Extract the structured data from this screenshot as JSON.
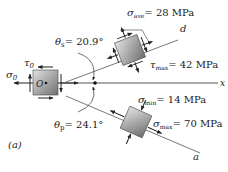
{
  "figure": {
    "panel_label": "(a)",
    "origin_label": "O",
    "axis_x_label": "x",
    "axis_d_label": "d",
    "axis_a_label": "a",
    "theta_s": {
      "symbol": "θ",
      "sub": "s",
      "value": "= 20.9°"
    },
    "theta_p": {
      "symbol": "θ",
      "sub": "p",
      "value": "= 24.1°"
    },
    "sigma0": {
      "symbol": "σ",
      "sub": "0"
    },
    "tau0": {
      "symbol": "τ",
      "sub": "0"
    },
    "sigma_ave": {
      "symbol": "σ",
      "sub": "ave",
      "value": "= 28 MPa"
    },
    "tau_max": {
      "symbol": "τ",
      "sub": "max",
      "value": "= 42 MPa"
    },
    "sigma_min": {
      "symbol": "σ",
      "sub": "min",
      "value": "= 14 MPa"
    },
    "sigma_max": {
      "symbol": "σ",
      "sub": "max",
      "value": "= 70 MPa"
    }
  },
  "colors": {
    "element_fill_light": "#d8d8d8",
    "element_fill_dark": "#7a7a7a",
    "line": "#333333",
    "arrow": "#222222"
  }
}
